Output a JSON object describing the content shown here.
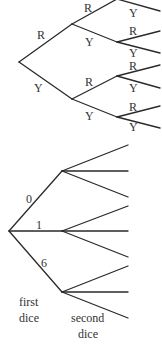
{
  "top_tree": {
    "level1": [
      {
        "label": "R"
      },
      {
        "label": "Y"
      }
    ],
    "level2": [
      {
        "label": "R"
      },
      {
        "label": "Y"
      },
      {
        "label": "R"
      },
      {
        "label": "Y"
      }
    ],
    "level3": [
      {
        "label": "Y"
      },
      {
        "label": "R"
      },
      {
        "label": "Y"
      },
      {
        "label": "R"
      },
      {
        "label": "Y"
      },
      {
        "label": "R"
      },
      {
        "label": "Y"
      }
    ]
  },
  "bottom_tree": {
    "branches": [
      {
        "label": "0"
      },
      {
        "label": "1"
      },
      {
        "label": "6"
      }
    ],
    "captions": {
      "first": [
        "first",
        "dice"
      ],
      "second": [
        "second",
        "dice"
      ]
    }
  },
  "colors": {
    "line": "#2a2a2a",
    "text": "#333333",
    "background": "#ffffff"
  }
}
